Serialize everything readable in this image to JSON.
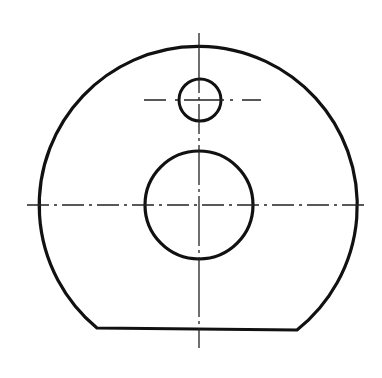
{
  "drawing": {
    "type": "technical-part-drawing",
    "colors": {
      "stroke": "#111111",
      "background": "#ffffff"
    },
    "outer_profile": {
      "center": [
        199,
        205
      ],
      "radius": 159,
      "flat_bottom": {
        "x1": 97,
        "y1": 328,
        "x2": 297,
        "y2": 330
      }
    },
    "large_hole": {
      "center": [
        199,
        205
      ],
      "radius": 54
    },
    "small_hole": {
      "center": [
        200,
        100
      ],
      "radius": 21
    },
    "centerlines": {
      "main_horizontal": {
        "x1": 27,
        "x2": 365,
        "y": 205
      },
      "main_vertical": {
        "x": 199,
        "y1": 33,
        "y2": 348
      },
      "small_hole_horizontal": {
        "x1": 144,
        "x2": 261,
        "y": 100
      }
    }
  }
}
